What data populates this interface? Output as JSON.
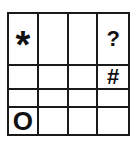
{
  "grid": {
    "rows": 4,
    "cols": 4,
    "cells": [
      [
        "*",
        "",
        "",
        "?"
      ],
      [
        "",
        "",
        "",
        "#"
      ],
      [
        "",
        "",
        "",
        ""
      ],
      [
        "O",
        "",
        "",
        ""
      ]
    ]
  },
  "colors": {
    "line": "#1a1a1a",
    "symbol": "#111111",
    "background": "#ffffff"
  }
}
